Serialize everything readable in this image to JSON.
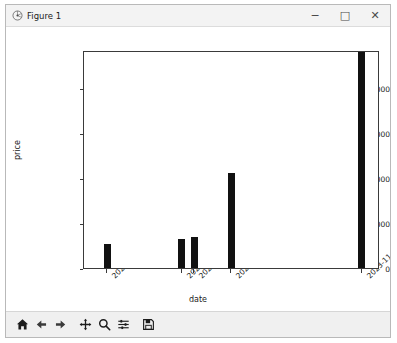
{
  "window": {
    "title": "Figure 1",
    "app_icon": "matplotlib-icon",
    "minimize_label": "−",
    "maximize_label": "□",
    "close_label": "✕"
  },
  "toolbar": {
    "buttons": [
      {
        "name": "home-icon",
        "tooltip": "Reset original view"
      },
      {
        "name": "back-arrow-icon",
        "tooltip": "Back to previous view"
      },
      {
        "name": "forward-arrow-icon",
        "tooltip": "Forward to next view"
      },
      {
        "name": "pan-move-icon",
        "tooltip": "Pan axes with left mouse, zoom with right"
      },
      {
        "name": "zoom-magnifier-icon",
        "tooltip": "Zoom to rectangle"
      },
      {
        "name": "configure-subplots-icon",
        "tooltip": "Configure subplots"
      },
      {
        "name": "save-floppy-icon",
        "tooltip": "Save the figure"
      }
    ]
  },
  "chart_data": {
    "type": "bar",
    "title": "",
    "xlabel": "date",
    "ylabel": "price",
    "categories": [
      "2023-10-31",
      "2023-11-09",
      "2023-11-10",
      "2023-11-14",
      "2023-11-29"
    ],
    "values": [
      2700000,
      3200000,
      3400000,
      10500000,
      24000000
    ],
    "ylim": [
      0,
      24200000
    ],
    "yticks": [
      0,
      5000000,
      10000000,
      15000000,
      20000000
    ],
    "ytick_labels": [
      "0",
      "5,000,000",
      "10,000,000",
      "15,000,000",
      "20,000,000"
    ],
    "xtick_labels": [
      "2023-10-31",
      "2023-11-09",
      "2023-11-10",
      "2023-11-14",
      "2023-11-29"
    ],
    "xtick_rotation": -45,
    "grid": false,
    "legend": false,
    "bar_color": "#111111"
  }
}
